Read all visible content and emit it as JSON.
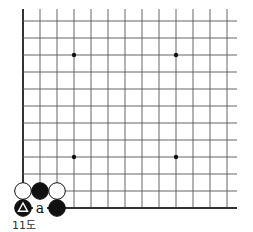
{
  "diagram": {
    "type": "go-board-fragment",
    "caption": "11도",
    "grid": {
      "origin_x": 23,
      "bottom_y": 208,
      "spacing": 17,
      "columns": 13,
      "rows": 12,
      "right_extent": 237,
      "top_extent": 9,
      "line_color": "#555555",
      "edge_color": "#333333"
    },
    "star_points": [
      {
        "col": 3,
        "row": 9
      },
      {
        "col": 9,
        "row": 9
      },
      {
        "col": 3,
        "row": 3
      },
      {
        "col": 9,
        "row": 3
      }
    ],
    "stones": [
      {
        "col": 0,
        "row": 1,
        "color": "white",
        "marker": ""
      },
      {
        "col": 1,
        "row": 1,
        "color": "black",
        "marker": ""
      },
      {
        "col": 2,
        "row": 1,
        "color": "white",
        "marker": ""
      },
      {
        "col": 0,
        "row": 0,
        "color": "black",
        "marker": "triangle"
      },
      {
        "col": 2,
        "row": 0,
        "color": "black",
        "marker": ""
      }
    ],
    "labels": [
      {
        "col": 1,
        "row": 0,
        "text": "a"
      }
    ]
  }
}
